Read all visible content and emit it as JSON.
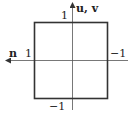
{
  "diagram": {
    "axes": {
      "vertical_label": "u, v",
      "horizontal_label": "n",
      "vertical_arrow_direction": "up",
      "horizontal_arrow_direction": "left"
    },
    "tick_labels": {
      "top": "1",
      "bottom": "−1",
      "left": "1",
      "right": "−1"
    },
    "square": {
      "corners": [
        [
          1,
          1
        ],
        [
          -1,
          1
        ],
        [
          -1,
          -1
        ],
        [
          1,
          -1
        ]
      ],
      "stroke_color": "#333333"
    },
    "axis_color": "#555555"
  }
}
